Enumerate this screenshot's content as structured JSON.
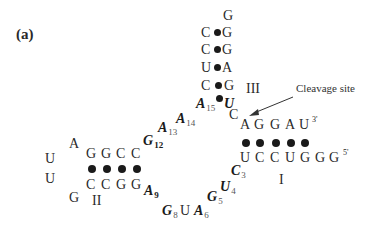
{
  "panel_label": "(a)",
  "annotation": {
    "text": "Cleavage site"
  },
  "stems": {
    "I": {
      "label": "I",
      "top_strand": [
        "A",
        "G",
        "G",
        "A",
        "U"
      ],
      "top_end": "3'",
      "bottom_strand": [
        "U",
        "C",
        "C",
        "U",
        "G",
        "G",
        "G"
      ],
      "bottom_end": "5'",
      "pairs": 5
    },
    "II": {
      "label": "II",
      "top_strand": [
        "G",
        "G",
        "C",
        "C"
      ],
      "bottom_strand": [
        "C",
        "C",
        "G",
        "G"
      ],
      "pairs": 4
    },
    "III": {
      "label": "III",
      "loop_top": "G",
      "pairs": [
        [
          "C",
          "G"
        ],
        [
          "C",
          "G"
        ],
        [
          "U",
          "A"
        ],
        [
          "C",
          "G"
        ],
        [
          "A",
          "U"
        ]
      ],
      "pair_indices": [
        null,
        null,
        null,
        null,
        [
          "15",
          ""
        ]
      ]
    }
  },
  "loop_II": [
    "A",
    "U",
    "U",
    "G"
  ],
  "cleavage_nucleotide": "C",
  "core": {
    "C3": {
      "base": "C",
      "index": "3"
    },
    "U4": {
      "base": "U",
      "index": "4"
    },
    "G5": {
      "base": "G",
      "index": "5"
    },
    "A6": {
      "base": "A",
      "index": "6"
    },
    "U7": {
      "base": "U",
      "index": ""
    },
    "G8": {
      "base": "G",
      "index": "8"
    },
    "A9": {
      "base": "A",
      "index": "9"
    },
    "G12": {
      "base": "G",
      "index": "12"
    },
    "A13": {
      "base": "A",
      "index": "13"
    },
    "A14": {
      "base": "A",
      "index": "14"
    },
    "A15": {
      "base": "A",
      "index": "15"
    },
    "U16": {
      "base": "U",
      "index": ""
    }
  }
}
